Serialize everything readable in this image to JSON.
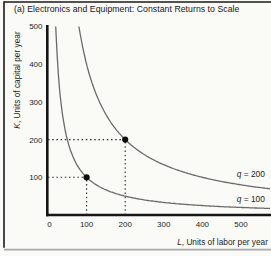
{
  "chart_data": {
    "type": "line",
    "title": "(a) Electronics and Equipment: Constant Returns to Scale",
    "xlabel": {
      "var": "L",
      "rest": ", Units of labor per year"
    },
    "ylabel": {
      "var": "K",
      "rest": ", Units of capital per year"
    },
    "xlim": [
      0,
      575
    ],
    "ylim": [
      0,
      500
    ],
    "x_ticks": [
      0,
      100,
      200,
      300,
      400,
      500
    ],
    "y_ticks": [
      100,
      200,
      300,
      400,
      500
    ],
    "grid": false,
    "legend_position": "none",
    "series": [
      {
        "name": "q = 100",
        "label": {
          "var": "q",
          "rest": " = 100"
        },
        "kl_constant": 10000,
        "label_anchor": {
          "L": 562,
          "K": 35
        },
        "color": "#6a6a6a"
      },
      {
        "name": "q = 200",
        "label": {
          "var": "q",
          "rest": " = 200"
        },
        "kl_constant": 40000,
        "label_anchor": {
          "L": 562,
          "K": 100
        },
        "color": "#6a6a6a"
      }
    ],
    "marked_points": [
      {
        "L": 100,
        "K": 100,
        "on": "q = 100"
      },
      {
        "L": 200,
        "K": 200,
        "on": "q = 200"
      }
    ],
    "guides": [
      {
        "from": {
          "L": 0,
          "K": 100
        },
        "to": {
          "L": 100,
          "K": 100
        }
      },
      {
        "from": {
          "L": 100,
          "K": 0
        },
        "to": {
          "L": 100,
          "K": 100
        }
      },
      {
        "from": {
          "L": 0,
          "K": 200
        },
        "to": {
          "L": 200,
          "K": 200
        }
      },
      {
        "from": {
          "L": 200,
          "K": 0
        },
        "to": {
          "L": 200,
          "K": 200
        }
      }
    ]
  },
  "colors": {
    "background": "#fafaf7",
    "axis": "#151515",
    "curve": "#6a6a6a",
    "text": "#1c1c1c",
    "point": "#0c0c0c",
    "guide": "#2a2a2a",
    "frame": "#1a1a1a",
    "bottom_rule": "#a8a8a8"
  }
}
